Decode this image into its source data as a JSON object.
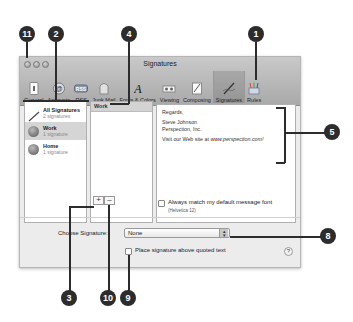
{
  "window": {
    "title": "Signatures"
  },
  "toolbar": {
    "items": [
      {
        "label": "General",
        "icon": "general-icon"
      },
      {
        "label": "Accounts",
        "icon": "accounts-icon"
      },
      {
        "label": "RSS",
        "icon": "rss-icon"
      },
      {
        "label": "Junk Mail",
        "icon": "junk-mail-icon"
      },
      {
        "label": "Fonts & Colors",
        "icon": "fonts-colors-icon"
      },
      {
        "label": "Viewing",
        "icon": "viewing-icon"
      },
      {
        "label": "Composing",
        "icon": "composing-icon"
      },
      {
        "label": "Signatures",
        "icon": "signatures-icon",
        "active": true
      },
      {
        "label": "Rules",
        "icon": "rules-icon"
      }
    ]
  },
  "accounts": [
    {
      "name": "All Signatures",
      "count": "2 signatures"
    },
    {
      "name": "Work",
      "count": "1 signature",
      "selected": true
    },
    {
      "name": "Home",
      "count": "1 signature"
    }
  ],
  "signatures": {
    "items": [
      "Work"
    ]
  },
  "preview": {
    "line1": "Regards,",
    "line2": "Steve Johnson",
    "line3": "Perspection, Inc.",
    "line4_prefix": "Visit our Web site at ",
    "line4_link": "www.perspection.com!"
  },
  "buttons": {
    "add": "+",
    "remove": "–"
  },
  "options": {
    "match_font_label": "Always match my default message font",
    "match_font_sub": "(Helvetica 12)",
    "choose_signature_label": "Choose Signature:",
    "choose_signature_value": "None",
    "place_above_label": "Place signature above quoted text",
    "help": "?"
  },
  "callouts": [
    "11",
    "2",
    "4",
    "1",
    "5",
    "8",
    "3",
    "10",
    "9"
  ]
}
